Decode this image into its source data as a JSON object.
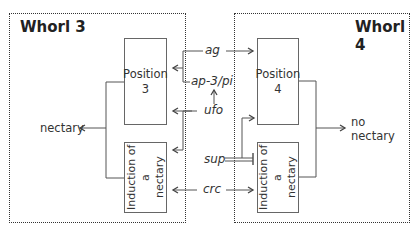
{
  "whorls": {
    "left": {
      "title": "Whorl 3"
    },
    "right": {
      "title": "Whorl 4"
    }
  },
  "boxes": {
    "position3": {
      "label": "Position 3",
      "line1": "Position",
      "line2": "3"
    },
    "induction_left": {
      "line1": "Induction of a",
      "line2": "nectary"
    },
    "position4": {
      "label": "Position 4",
      "line1": "Position",
      "line2": "4"
    },
    "induction_right": {
      "line1": "Induction of a",
      "line2": "nectary"
    }
  },
  "genes": {
    "ag": "ag",
    "ap3pi": "ap-3/pi",
    "ufo": "ufo",
    "sup": "sup",
    "crc": "crc"
  },
  "outcomes": {
    "left": "nectary",
    "right_line1": "no",
    "right_line2": "nectary"
  },
  "colors": {
    "line": "#555555",
    "border": "#333333",
    "text": "#333333"
  }
}
